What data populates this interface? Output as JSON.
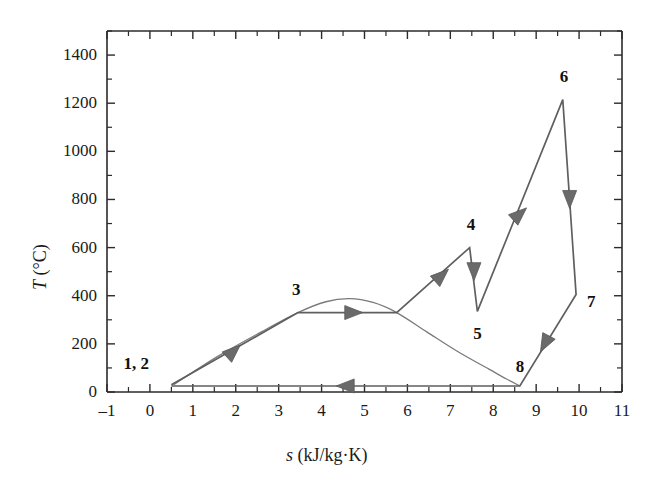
{
  "chart_data": {
    "type": "line",
    "title": "",
    "xlabel": "s (kJ/kg·K)",
    "xlabel_italic_symbol": "s",
    "xlabel_unit": " (kJ/kg·K)",
    "ylabel": "T (°C)",
    "ylabel_italic_symbol": "T",
    "ylabel_unit": " (°C)",
    "xlim": [
      -1,
      11
    ],
    "ylim": [
      0,
      1500
    ],
    "xticks": [
      -1,
      0,
      1,
      2,
      3,
      4,
      5,
      6,
      7,
      8,
      9,
      10,
      11
    ],
    "xticklabels": [
      "–1",
      "0",
      "1",
      "2",
      "3",
      "4",
      "5",
      "6",
      "7",
      "8",
      "9",
      "10",
      "11"
    ],
    "yticks": [
      0,
      200,
      400,
      600,
      800,
      1000,
      1200,
      1400
    ],
    "yticklabels": [
      "0",
      "200",
      "400",
      "600",
      "800",
      "1000",
      "1200",
      "1400"
    ],
    "yminorticks": [
      100,
      300,
      500,
      700,
      900,
      1100,
      1300,
      1500
    ],
    "grid": false,
    "legend": null,
    "line_color": "#5a5a5a",
    "dome_color": "#707070",
    "axis_color": "#2b2b2b",
    "series": [
      {
        "name": "cycle-path",
        "comment": "Closed thermodynamic cycle 1,2 -> 3 -> 4 -> 5 -> 6 -> 7 -> 8 -> 1,2",
        "points": [
          {
            "s": 0.5,
            "T": 30,
            "state": "1, 2"
          },
          {
            "s": 3.45,
            "T": 330,
            "state": "3"
          },
          {
            "s": 5.75,
            "T": 330,
            "state": ""
          },
          {
            "s": 7.45,
            "T": 600,
            "state": "4"
          },
          {
            "s": 7.63,
            "T": 335,
            "state": "5"
          },
          {
            "s": 9.62,
            "T": 1215,
            "state": "6"
          },
          {
            "s": 9.93,
            "T": 405,
            "state": "7"
          },
          {
            "s": 8.62,
            "T": 25,
            "state": "8"
          },
          {
            "s": 0.5,
            "T": 25,
            "state": ""
          }
        ]
      },
      {
        "name": "saturation-dome",
        "comment": "Vapor dome; left branch overlaps 1,2-3 line, peak near s=4.6",
        "points": [
          {
            "s": 0.55,
            "T": 30
          },
          {
            "s": 1.6,
            "T": 150
          },
          {
            "s": 2.6,
            "T": 250
          },
          {
            "s": 3.45,
            "T": 330
          },
          {
            "s": 4.1,
            "T": 375
          },
          {
            "s": 4.65,
            "T": 388
          },
          {
            "s": 5.2,
            "T": 372
          },
          {
            "s": 5.75,
            "T": 330
          },
          {
            "s": 6.45,
            "T": 250
          },
          {
            "s": 7.2,
            "T": 165
          },
          {
            "s": 7.9,
            "T": 95
          },
          {
            "s": 8.3,
            "T": 55
          },
          {
            "s": 8.62,
            "T": 25
          }
        ]
      }
    ],
    "state_labels": [
      {
        "id": "1, 2",
        "s": 0.5,
        "T": 30,
        "label_dx": -48,
        "label_dy": -22
      },
      {
        "id": "3",
        "s": 3.45,
        "T": 330,
        "label_dx": -6,
        "label_dy": -24
      },
      {
        "id": "4",
        "s": 7.45,
        "T": 600,
        "label_dx": -3,
        "label_dy": -24
      },
      {
        "id": "5",
        "s": 7.63,
        "T": 335,
        "label_dx": -4,
        "label_dy": 22
      },
      {
        "id": "6",
        "s": 9.62,
        "T": 1215,
        "label_dx": -3,
        "label_dy": -24
      },
      {
        "id": "7",
        "s": 9.93,
        "T": 405,
        "label_dx": 11,
        "label_dy": 6
      },
      {
        "id": "8",
        "s": 8.62,
        "T": 25,
        "label_dx": -4,
        "label_dy": -20
      }
    ],
    "arrows": [
      {
        "on": "1,2->3",
        "s": 1.95,
        "T": 170,
        "dir": "up-right"
      },
      {
        "on": "3->4 isobar",
        "s": 4.75,
        "T": 330,
        "dir": "right"
      },
      {
        "on": "dome-right->4",
        "s": 6.8,
        "T": 485,
        "dir": "up-right"
      },
      {
        "on": "4->5",
        "s": 7.55,
        "T": 500,
        "dir": "down"
      },
      {
        "on": "5->6",
        "s": 8.62,
        "T": 740,
        "dir": "up-right"
      },
      {
        "on": "6->7",
        "s": 9.78,
        "T": 800,
        "dir": "down"
      },
      {
        "on": "7->8",
        "s": 9.2,
        "T": 200,
        "dir": "down-left"
      },
      {
        "on": "8->1,2",
        "s": 4.55,
        "T": 25,
        "dir": "left"
      }
    ]
  }
}
